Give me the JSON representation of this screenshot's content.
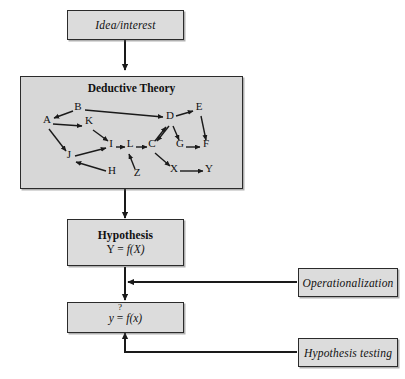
{
  "diagram": {
    "boxes": {
      "idea": {
        "label": "Idea/interest"
      },
      "theory": {
        "title": "Deductive Theory"
      },
      "hypothesis": {
        "title": "Hypothesis",
        "formula_left": "Y",
        "formula_eq": "=",
        "formula_right": "f(X)"
      },
      "empirical": {
        "formula_left": "y",
        "formula_eq": "=",
        "formula_q": "?",
        "formula_right": "f(x)"
      },
      "operationalization": {
        "label": "Operationalization"
      },
      "hypothesis_testing": {
        "label": "Hypothesis testing"
      }
    },
    "nodes": [
      {
        "id": "A",
        "label": "A",
        "x": 47,
        "y": 123
      },
      {
        "id": "B",
        "label": "B",
        "x": 78,
        "y": 110
      },
      {
        "id": "K",
        "label": "K",
        "x": 89,
        "y": 124
      },
      {
        "id": "D",
        "label": "D",
        "x": 170,
        "y": 119
      },
      {
        "id": "E",
        "label": "E",
        "x": 199,
        "y": 110
      },
      {
        "id": "I",
        "label": "I",
        "x": 111,
        "y": 147
      },
      {
        "id": "L",
        "label": "L",
        "x": 130,
        "y": 147
      },
      {
        "id": "C",
        "label": "C",
        "x": 152,
        "y": 147
      },
      {
        "id": "G",
        "label": "G",
        "x": 180,
        "y": 147
      },
      {
        "id": "F",
        "label": "F",
        "x": 206,
        "y": 147
      },
      {
        "id": "J",
        "label": "J",
        "x": 69,
        "y": 158
      },
      {
        "id": "H",
        "label": "H",
        "x": 112,
        "y": 174
      },
      {
        "id": "Z",
        "label": "Z",
        "x": 137,
        "y": 176
      },
      {
        "id": "X",
        "label": "X",
        "x": 174,
        "y": 172
      },
      {
        "id": "Y",
        "label": "Y",
        "x": 209,
        "y": 172
      }
    ],
    "edges": [
      {
        "from": "B",
        "to": "A"
      },
      {
        "from": "A",
        "to": "K"
      },
      {
        "from": "B",
        "to": "D"
      },
      {
        "from": "A",
        "to": "J"
      },
      {
        "from": "K",
        "to": "I"
      },
      {
        "from": "J",
        "to": "I"
      },
      {
        "from": "I",
        "to": "L"
      },
      {
        "from": "L",
        "to": "C"
      },
      {
        "from": "C",
        "to": "D"
      },
      {
        "from": "D",
        "to": "E"
      },
      {
        "from": "D",
        "to": "C"
      },
      {
        "from": "D",
        "to": "G"
      },
      {
        "from": "E",
        "to": "F"
      },
      {
        "from": "G",
        "to": "F"
      },
      {
        "from": "C",
        "to": "X"
      },
      {
        "from": "X",
        "to": "Y"
      },
      {
        "from": "Z",
        "to": "L"
      },
      {
        "from": "H",
        "to": "J"
      }
    ],
    "flow_arrows": [
      {
        "name": "idea-to-theory"
      },
      {
        "name": "theory-to-hypothesis"
      },
      {
        "name": "hypothesis-to-empirical"
      },
      {
        "name": "operationalization-to-flow"
      },
      {
        "name": "hypothesis-testing-to-empirical"
      }
    ],
    "colors": {
      "box_fill": "#dcdcdc",
      "box_border": "#2b2b2b",
      "line": "#1a1a1a",
      "page_background": "#ffffff"
    }
  }
}
